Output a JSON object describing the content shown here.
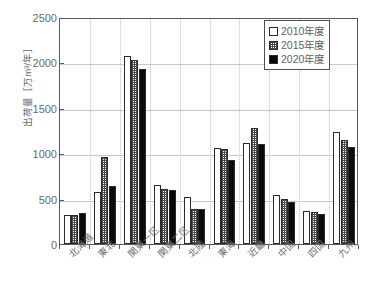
{
  "chart_data": {
    "type": "bar",
    "title": "",
    "xlabel": "",
    "ylabel": "出荷量［万m³/年］",
    "ylim": [
      0,
      2500
    ],
    "yticks": [
      0,
      500,
      1000,
      1500,
      2000,
      2500
    ],
    "ytick_labels": [
      "0",
      "500",
      "1000",
      "1500",
      "2000",
      "2500"
    ],
    "grid": true,
    "legend_position": "top-right",
    "categories": [
      "北海道",
      "東北",
      "関東一区",
      "関東二区",
      "北陸",
      "東海",
      "近畿",
      "中国",
      "四国",
      "九州"
    ],
    "series": [
      {
        "name": "2010年度",
        "fill": "white",
        "color": "#ffffff",
        "edge_color": "#2b2b2b",
        "values": [
          320,
          570,
          2075,
          645,
          515,
          1055,
          1115,
          535,
          365,
          1230
        ]
      },
      {
        "name": "2015年度",
        "fill": "hatched",
        "color": "#b9b9b9",
        "edge_color": "#2b2b2b",
        "values": [
          320,
          960,
          2030,
          610,
          390,
          1045,
          1280,
          495,
          355,
          1150
        ]
      },
      {
        "name": "2020年度",
        "fill": "solid",
        "color": "#0a0a0a",
        "edge_color": "#2b2b2b",
        "values": [
          345,
          640,
          1925,
          600,
          390,
          920,
          1105,
          460,
          330,
          1070
        ]
      }
    ]
  },
  "legend": {
    "items": [
      {
        "label": "2010年度",
        "swatch": "open-square"
      },
      {
        "label": "2015年度",
        "swatch": "hatched-square"
      },
      {
        "label": "2020年度",
        "swatch": "filled-square"
      }
    ]
  }
}
